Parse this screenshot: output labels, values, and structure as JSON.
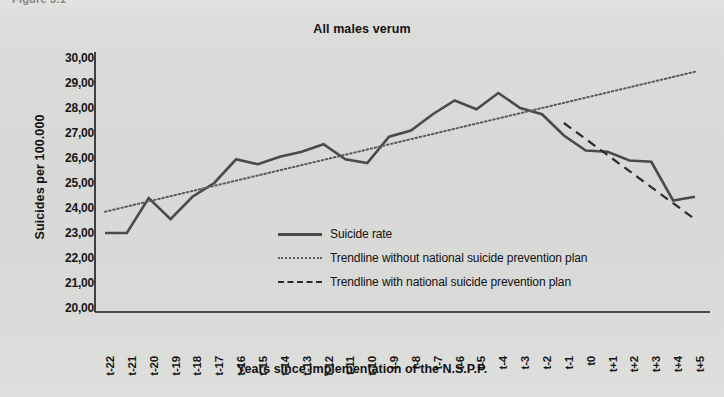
{
  "figure_label": "Figure 3.1",
  "axis": {
    "y_title": "Suicides per 100.000",
    "x_title": "Years since implementation of the N.S.P.P."
  },
  "legend": {
    "items": [
      {
        "key": "solid-line-key",
        "label": "Suicide rate"
      },
      {
        "key": "dotted-line-key",
        "label": "Trendline without national suicide prevention plan"
      },
      {
        "key": "dashed-line-key",
        "label": "Trendline with national suicide prevention plan"
      }
    ]
  },
  "colors": {
    "background": "#d9d9d7",
    "plot_background": "#d9d9d7",
    "series_line": "#4a4a4a",
    "trend_without": "#5a5a5a",
    "trend_with": "#2b2b2b",
    "axis": "#1a1a1a",
    "text": "#121212"
  },
  "chart_data": {
    "type": "line",
    "title": "All males verum",
    "xlabel": "Years since implementation of the N.S.P.P.",
    "ylabel": "Suicides per 100.000",
    "ylim": [
      20.0,
      30.0
    ],
    "ytick_step": 1.0,
    "ytick_labels": [
      "30,00",
      "29,00",
      "28,00",
      "27,00",
      "26,00",
      "25,00",
      "24,00",
      "23,00",
      "22,00",
      "21,00",
      "20,00"
    ],
    "ytick_values": [
      30.0,
      29.0,
      28.0,
      27.0,
      26.0,
      25.0,
      24.0,
      23.0,
      22.0,
      21.0,
      20.0
    ],
    "grid": false,
    "legend_position": "center",
    "categories": [
      "t-22",
      "t-21",
      "t-20",
      "t-19",
      "t-18",
      "t-17",
      "t-16",
      "t-15",
      "t-14",
      "t-13",
      "t-12",
      "t-11",
      "t-10",
      "t-9",
      "t-8",
      "t-7",
      "t-6",
      "t-5",
      "t-4",
      "t-3",
      "t-2",
      "t-1",
      "t0",
      "t+1",
      "t+2",
      "t+3",
      "t+4",
      "t+5"
    ],
    "series": [
      {
        "name": "Suicide rate",
        "style": "solid",
        "values": [
          23.0,
          23.0,
          24.4,
          23.55,
          24.45,
          25.0,
          25.95,
          25.75,
          26.05,
          26.25,
          26.55,
          25.95,
          25.8,
          26.85,
          27.1,
          27.75,
          28.3,
          27.95,
          28.6,
          28.0,
          27.75,
          26.9,
          26.3,
          26.25,
          25.9,
          25.85,
          24.3,
          24.45
        ]
      },
      {
        "name": "Trendline without national suicide prevention plan",
        "style": "dotted",
        "x_start": "t-22",
        "x_end": "t+5",
        "y_start": 23.85,
        "y_end": 29.45
      },
      {
        "name": "Trendline with national suicide prevention plan",
        "style": "dashed",
        "x_start": "t-1",
        "x_end": "t+5",
        "y_start": 27.4,
        "y_end": 23.55
      }
    ]
  }
}
